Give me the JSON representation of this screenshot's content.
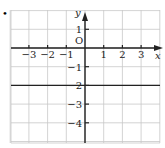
{
  "bullet": "•",
  "chart_data": {
    "type": "line",
    "title": "",
    "xlabel": "x",
    "ylabel": "y",
    "origin_label": "O",
    "xlim": [
      -4,
      4
    ],
    "ylim": [
      -5,
      2
    ],
    "grid": true,
    "x_ticks": [
      -3,
      -2,
      -1,
      1,
      2,
      3
    ],
    "x_tick_labels": [
      "−3",
      "−2",
      "−1",
      "1",
      "2",
      "3"
    ],
    "y_ticks": [
      1,
      -1,
      -2,
      -3,
      -4
    ],
    "y_tick_labels": [
      "1",
      "−1",
      "−2",
      "−3",
      "−4"
    ],
    "series": [
      {
        "name": "y = -2",
        "x": [
          -4,
          4
        ],
        "y": [
          -2,
          -2
        ],
        "color": "#222222"
      }
    ]
  },
  "colors": {
    "grid": "#c8c8c8",
    "axis": "#222222",
    "line": "#222222"
  }
}
